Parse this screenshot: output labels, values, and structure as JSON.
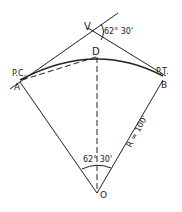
{
  "diagram": {
    "labels": {
      "vertex": "V",
      "deflection_angle": "62° 30'",
      "midpoint": "D",
      "pc": "P.C.",
      "point_a": "A",
      "pt": "P.T.",
      "point_b": "B",
      "center": "O",
      "central_angle": "62° 30'",
      "radius": "R = 100'"
    },
    "colors": {
      "line": "#222222",
      "background": "#ffffff"
    }
  }
}
